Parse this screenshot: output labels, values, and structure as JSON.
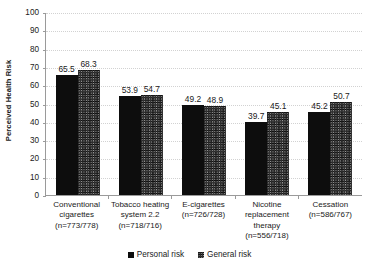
{
  "chart_data": {
    "type": "bar",
    "title": "",
    "xlabel": "",
    "ylabel": "Perceived Health Risk",
    "ylim": [
      0,
      100
    ],
    "ytick_step": 10,
    "yticks": [
      100,
      90,
      80,
      70,
      60,
      50,
      40,
      30,
      20,
      10,
      0
    ],
    "grid": true,
    "legend_position": "bottom",
    "categories": [
      "Conventional cigarettes (n=773/778)",
      "Tobacco heating system 2.2 (n=718/716)",
      "E-cigarettes (n=726/728)",
      "Nicotine replacement therapy (n=556/718)",
      "Cessation (n=586/767)"
    ],
    "category_lines": [
      [
        "Conventional",
        "cigarettes",
        "(n=773/778)"
      ],
      [
        "Tobacco heating",
        "system 2.2",
        "(n=718/716)"
      ],
      [
        "E-cigarettes",
        "(n=726/728)"
      ],
      [
        "Nicotine",
        "replacement",
        "therapy",
        "(n=556/718)"
      ],
      [
        "Cessation",
        "(n=586/767)"
      ]
    ],
    "series": [
      {
        "name": "Personal risk",
        "color": "#0d0d0d",
        "pattern": "solid",
        "values": [
          65.5,
          53.9,
          49.2,
          39.7,
          45.2
        ]
      },
      {
        "name": "General risk",
        "color": "#9c9c9c",
        "pattern": "crosshatch",
        "values": [
          68.3,
          54.7,
          48.9,
          45.1,
          50.7
        ]
      }
    ]
  },
  "axis": {
    "y_title": "Perceived Health Risk"
  },
  "legend": {
    "items": [
      {
        "label": "Personal risk"
      },
      {
        "label": "General risk"
      }
    ]
  },
  "colors": {
    "personal": "#0d0d0d",
    "general": "#9c9c9c",
    "axis": "#9a9a9a",
    "grid": "#d2d2d2",
    "background": "#ffffff",
    "text": "#1a1a1a"
  }
}
